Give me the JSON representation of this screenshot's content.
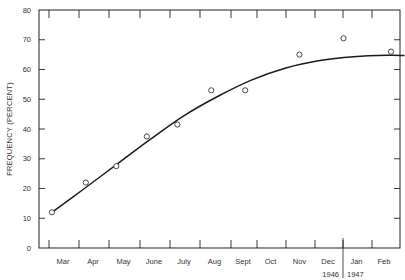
{
  "chart_data": {
    "type": "scatter",
    "title": "",
    "xlabel": "",
    "ylabel": "FREQUENCY (PERCENT)",
    "ylim": [
      0,
      80
    ],
    "yticks": [
      0,
      10,
      20,
      30,
      40,
      50,
      60,
      70,
      80
    ],
    "categories": [
      "Mar",
      "Apr",
      "May",
      "June",
      "July",
      "Aug",
      "Sept",
      "Oct",
      "Nov",
      "Dec",
      "Jan",
      "Feb"
    ],
    "year_labels": [
      {
        "label": "1946",
        "under": "Dec"
      },
      {
        "label": "1947",
        "under": "Jan"
      }
    ],
    "grid": false,
    "legend": null,
    "series": [
      {
        "name": "Observed",
        "kind": "points",
        "marker": "open-circle",
        "points": [
          {
            "x": 0.1,
            "y": 12
          },
          {
            "x": 1.1,
            "y": 22
          },
          {
            "x": 2.0,
            "y": 27.5
          },
          {
            "x": 2.9,
            "y": 37.5
          },
          {
            "x": 3.8,
            "y": 41.5
          },
          {
            "x": 4.8,
            "y": 53
          },
          {
            "x": 5.8,
            "y": 53
          },
          {
            "x": 7.4,
            "y": 65
          },
          {
            "x": 8.7,
            "y": 70.5
          },
          {
            "x": 10.1,
            "y": 66
          }
        ]
      },
      {
        "name": "Fitted curve",
        "kind": "line",
        "points": [
          {
            "x": 0.1,
            "y": 12
          },
          {
            "x": 1.0,
            "y": 19.5
          },
          {
            "x": 2.0,
            "y": 28
          },
          {
            "x": 3.0,
            "y": 36.5
          },
          {
            "x": 4.0,
            "y": 44.5
          },
          {
            "x": 5.0,
            "y": 51
          },
          {
            "x": 6.0,
            "y": 56.5
          },
          {
            "x": 7.0,
            "y": 60.5
          },
          {
            "x": 8.0,
            "y": 63
          },
          {
            "x": 9.0,
            "y": 64.3
          },
          {
            "x": 10.0,
            "y": 64.8
          },
          {
            "x": 10.5,
            "y": 64.7
          }
        ]
      }
    ]
  }
}
